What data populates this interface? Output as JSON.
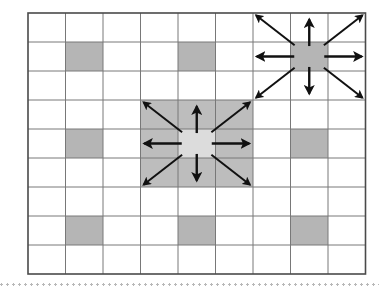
{
  "figure": {
    "grid": {
      "columns": 9,
      "rows": 9,
      "origin_x": 28,
      "origin_y": 13,
      "cell_width": 37.5,
      "cell_height": 29,
      "line_color": "#787878",
      "border_color": "#4a4a4a",
      "background_color": "#ffffff",
      "line_width": 1,
      "border_width": 1.6
    },
    "colors": {
      "obstacle_fill": "#b5b5b5",
      "neighborhood_fill": "#bdbdbd",
      "center_fill": "#dcdcdc",
      "arrow_color": "#111111",
      "dotted_rule_color": "#b8b8b8"
    },
    "obstacle_cells": [
      {
        "col": 1,
        "row": 1
      },
      {
        "col": 4,
        "row": 1
      },
      {
        "col": 1,
        "row": 4
      },
      {
        "col": 7,
        "row": 4
      },
      {
        "col": 1,
        "row": 7
      },
      {
        "col": 4,
        "row": 7
      },
      {
        "col": 7,
        "row": 7
      }
    ],
    "expansion_clusters": [
      {
        "name": "center-cluster",
        "center_col": 4,
        "center_row": 4,
        "neighborhood_shaded": true,
        "center_highlighted": true,
        "arrow_count": 8,
        "directions": [
          "N",
          "NE",
          "E",
          "SE",
          "S",
          "SW",
          "W",
          "NW"
        ]
      },
      {
        "name": "upper-right-cluster",
        "center_col": 7,
        "center_row": 1,
        "neighborhood_shaded": false,
        "center_highlighted": false,
        "arrow_count": 8,
        "directions": [
          "N",
          "NE",
          "E",
          "SE",
          "S",
          "SW",
          "W",
          "NW"
        ]
      }
    ],
    "dotted_rule": {
      "present": true,
      "y": 283,
      "width": 379
    }
  }
}
